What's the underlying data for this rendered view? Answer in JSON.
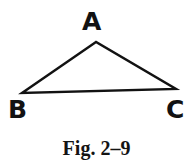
{
  "figure": {
    "caption": "Fig. 2–9",
    "background_color": "#ffffff",
    "ink_color": "#121212",
    "stroke_width": 2.4,
    "vertices": [
      {
        "label": "A",
        "x": 96,
        "y": 42
      },
      {
        "label": "B",
        "x": 22,
        "y": 93
      },
      {
        "label": "C",
        "x": 176,
        "y": 89
      }
    ],
    "labels": {
      "apex": "A",
      "bottom_left": "B",
      "bottom_right": "C"
    },
    "shape": "triangle"
  }
}
